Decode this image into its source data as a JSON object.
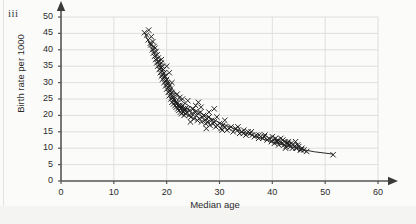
{
  "figure": {
    "label": "iii"
  },
  "chart_data": {
    "type": "scatter",
    "title": "",
    "xlabel": "Median age",
    "ylabel": "Birth rate per 1000",
    "xlim": [
      0,
      60
    ],
    "ylim": [
      0,
      50
    ],
    "xticks": [
      0,
      10,
      20,
      30,
      40,
      50,
      60
    ],
    "yticks": [
      0,
      5,
      10,
      15,
      20,
      25,
      30,
      35,
      40,
      45,
      50
    ],
    "grid": true,
    "grid_x_at": [
      10,
      20,
      30,
      40,
      50,
      60
    ],
    "grid_y_at": [
      5,
      10,
      15,
      20,
      25,
      30,
      35,
      40,
      45,
      50
    ],
    "marker": "x",
    "marker_color": "#1a1a1a",
    "axis_color": "#555555",
    "grid_color": "#d8d8d8",
    "trend_line": {
      "type": "curve",
      "color": "#2a2a2a",
      "points": [
        [
          15.8,
          45.2
        ],
        [
          17.0,
          41.0
        ],
        [
          18.5,
          36.0
        ],
        [
          20.0,
          31.0
        ],
        [
          21.5,
          27.0
        ],
        [
          23.0,
          24.2
        ],
        [
          25.0,
          22.0
        ],
        [
          27.0,
          20.2
        ],
        [
          30.0,
          17.8
        ],
        [
          33.0,
          15.8
        ],
        [
          36.0,
          14.0
        ],
        [
          39.0,
          12.4
        ],
        [
          42.0,
          11.0
        ],
        [
          45.0,
          9.8
        ],
        [
          48.0,
          8.9
        ],
        [
          51.5,
          8.2
        ]
      ]
    },
    "x": [
      15.8,
      16.2,
      16.5,
      16.6,
      16.9,
      17.0,
      17.1,
      17.3,
      17.4,
      17.5,
      17.6,
      17.7,
      17.8,
      17.9,
      18.0,
      18.1,
      18.2,
      18.3,
      18.4,
      18.5,
      18.6,
      18.7,
      18.8,
      18.9,
      19.0,
      19.0,
      19.1,
      19.2,
      19.2,
      19.3,
      19.4,
      19.5,
      19.5,
      19.6,
      19.7,
      19.8,
      19.9,
      20.0,
      20.0,
      20.1,
      20.2,
      20.3,
      20.4,
      20.5,
      20.5,
      20.6,
      20.7,
      20.8,
      20.9,
      21.0,
      21.0,
      21.1,
      21.2,
      21.3,
      21.4,
      21.5,
      21.6,
      21.7,
      21.8,
      21.9,
      22.0,
      22.1,
      22.2,
      22.3,
      22.4,
      22.5,
      22.6,
      22.7,
      22.8,
      22.9,
      23.0,
      23.1,
      23.2,
      23.3,
      23.4,
      23.5,
      23.6,
      23.8,
      24.0,
      24.2,
      24.4,
      24.6,
      24.8,
      25.0,
      25.2,
      25.4,
      25.6,
      25.8,
      26.0,
      26.2,
      26.4,
      26.6,
      26.8,
      27.0,
      27.2,
      27.4,
      27.6,
      27.8,
      28.0,
      28.2,
      28.5,
      28.8,
      29.0,
      29.3,
      29.6,
      30.0,
      30.3,
      30.6,
      31.0,
      31.4,
      31.8,
      32.2,
      32.6,
      33.0,
      33.4,
      33.8,
      34.2,
      34.6,
      35.0,
      35.4,
      35.8,
      36.2,
      36.6,
      37.0,
      37.4,
      37.8,
      38.2,
      38.6,
      39.0,
      39.4,
      39.8,
      40.0,
      40.2,
      40.4,
      40.6,
      40.8,
      41.0,
      41.2,
      41.4,
      41.6,
      41.8,
      42.0,
      42.2,
      42.4,
      42.6,
      42.8,
      43.0,
      43.2,
      43.4,
      43.6,
      43.8,
      44.0,
      44.2,
      44.4,
      44.6,
      44.8,
      45.0,
      45.3,
      45.6,
      46.0,
      19.0,
      20.5,
      21.0,
      22.0,
      23.0,
      24.0,
      25.5,
      26.5,
      28.0,
      29.5,
      31.0,
      33.5,
      36.0,
      38.5,
      41.0,
      43.0,
      44.5,
      46.5,
      51.5,
      24.5,
      27.5,
      30.5,
      34.5,
      37.5,
      42.5,
      45.5,
      20.0,
      22.5,
      26.0,
      29.0
    ],
    "y": [
      45.2,
      44.5,
      43.0,
      46.0,
      42.0,
      41.5,
      44.0,
      40.0,
      42.5,
      39.0,
      41.0,
      38.0,
      40.5,
      37.0,
      39.5,
      36.0,
      38.5,
      35.0,
      37.5,
      36.5,
      34.0,
      35.5,
      33.0,
      34.5,
      36.0,
      32.0,
      33.5,
      35.0,
      31.0,
      32.5,
      34.0,
      33.0,
      30.0,
      31.5,
      32.0,
      29.0,
      30.5,
      31.0,
      28.0,
      30.0,
      29.5,
      27.0,
      28.5,
      29.0,
      26.0,
      27.5,
      28.0,
      25.0,
      26.5,
      27.0,
      24.0,
      26.0,
      25.5,
      23.5,
      25.0,
      24.5,
      23.0,
      24.0,
      22.5,
      23.5,
      24.0,
      22.0,
      23.0,
      21.5,
      22.5,
      23.0,
      21.0,
      22.0,
      20.5,
      22.5,
      23.0,
      21.0,
      22.0,
      20.0,
      21.5,
      22.0,
      20.5,
      21.0,
      22.0,
      20.0,
      21.5,
      19.5,
      20.5,
      22.0,
      19.0,
      21.0,
      20.0,
      18.5,
      20.5,
      19.0,
      21.0,
      18.0,
      19.5,
      20.0,
      18.5,
      17.5,
      19.0,
      18.0,
      19.5,
      17.0,
      18.5,
      17.5,
      18.0,
      16.5,
      17.0,
      17.5,
      16.0,
      17.0,
      16.5,
      15.5,
      16.0,
      16.5,
      15.0,
      16.0,
      15.5,
      14.5,
      15.0,
      15.5,
      14.0,
      15.0,
      14.5,
      14.0,
      13.5,
      14.0,
      13.0,
      13.5,
      13.0,
      14.0,
      12.5,
      13.0,
      12.0,
      13.5,
      12.5,
      11.5,
      13.0,
      12.0,
      12.5,
      11.0,
      12.0,
      13.0,
      11.5,
      12.5,
      11.0,
      12.0,
      10.5,
      11.5,
      12.0,
      11.0,
      10.5,
      11.5,
      10.0,
      11.0,
      10.5,
      12.0,
      10.0,
      11.0,
      10.5,
      9.5,
      10.0,
      9.5,
      37.0,
      33.0,
      30.0,
      26.5,
      25.0,
      24.5,
      23.0,
      22.5,
      21.0,
      19.5,
      18.5,
      16.5,
      15.0,
      13.5,
      12.0,
      11.5,
      10.0,
      9.0,
      8.0,
      18.0,
      16.0,
      15.5,
      14.5,
      14.0,
      10.0,
      9.5,
      35.0,
      25.5,
      24.0,
      22.0
    ]
  }
}
